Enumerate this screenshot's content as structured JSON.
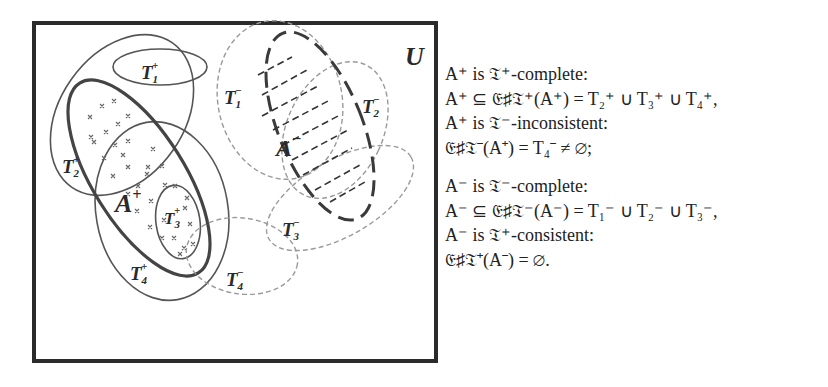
{
  "diagram": {
    "universe_label": "U",
    "sets": {
      "A_plus": {
        "label": "A",
        "sup": "+",
        "style": "thick solid, filled with crosses"
      },
      "A_minus": {
        "label": "A",
        "sup": "−",
        "style": "thick long-dashed, hatched with dashes"
      },
      "T_plus": [
        {
          "label": "T",
          "sub": "1",
          "sup": "+"
        },
        {
          "label": "T",
          "sub": "2",
          "sup": "+"
        },
        {
          "label": "T",
          "sub": "3",
          "sup": "+"
        },
        {
          "label": "T",
          "sub": "4",
          "sup": "+"
        }
      ],
      "T_minus": [
        {
          "label": "T",
          "sub": "1",
          "sup": "−"
        },
        {
          "label": "T",
          "sub": "2",
          "sup": "−"
        },
        {
          "label": "T",
          "sub": "3",
          "sup": "−"
        },
        {
          "label": "T",
          "sub": "4",
          "sup": "−"
        }
      ]
    },
    "colors": {
      "frame": "#2b2b2b",
      "solid_ellipse": "#555555",
      "dashed_ellipse": "#9a9a9a",
      "thick": "#444444"
    }
  },
  "text": {
    "block1": [
      "A⁺ is 𝔗⁺-complete:",
      "A⁺ ⊆ 𝔈♯𝔗⁺(A⁺) = T₂⁺ ∪ T₃⁺ ∪ T₄⁺,",
      "A⁺ is 𝔗⁻-inconsistent:",
      "𝔈♯𝔗⁻(A⁺) = T₄⁻ ≠ ∅;"
    ],
    "block2": [
      "A⁻ is 𝔗⁻-complete:",
      "A⁻ ⊆ 𝔈♯𝔗⁻(A⁻) = T₁⁻ ∪ T₂⁻ ∪ T₃⁻,",
      "A⁻ is 𝔗⁺-consistent:",
      "𝔈♯𝔗⁺(A⁻) = ∅."
    ]
  }
}
